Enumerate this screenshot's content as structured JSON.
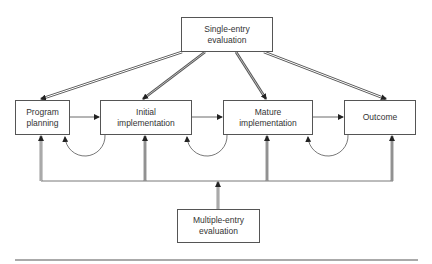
{
  "diagram": {
    "title": "",
    "nodes": {
      "single_entry": {
        "line1": "Single-entry",
        "line2": "evaluation"
      },
      "program_planning": {
        "line1": "Program",
        "line2": "planning"
      },
      "initial_implementation": {
        "line1": "Initial",
        "line2": "implementation"
      },
      "mature_implementation": {
        "line1": "Mature",
        "line2": "implementation"
      },
      "outcome": {
        "line1": "Outcome"
      },
      "multiple_entry": {
        "line1": "Multiple-entry",
        "line2": "evaluation"
      }
    },
    "edges": [
      {
        "from": "single_entry",
        "to": "program_planning",
        "style": "double"
      },
      {
        "from": "single_entry",
        "to": "initial_implementation",
        "style": "double"
      },
      {
        "from": "single_entry",
        "to": "mature_implementation",
        "style": "double"
      },
      {
        "from": "single_entry",
        "to": "outcome",
        "style": "double"
      },
      {
        "from": "program_planning",
        "to": "initial_implementation",
        "style": "single"
      },
      {
        "from": "initial_implementation",
        "to": "mature_implementation",
        "style": "single"
      },
      {
        "from": "mature_implementation",
        "to": "outcome",
        "style": "single"
      },
      {
        "from": "initial_implementation",
        "to": "program_planning",
        "style": "feedback-arc"
      },
      {
        "from": "mature_implementation",
        "to": "initial_implementation",
        "style": "feedback-arc"
      },
      {
        "from": "outcome",
        "to": "mature_implementation",
        "style": "feedback-arc"
      },
      {
        "from": "multiple_entry",
        "to": "program_planning",
        "style": "double"
      },
      {
        "from": "multiple_entry",
        "to": "initial_implementation",
        "style": "double"
      },
      {
        "from": "multiple_entry",
        "to": "mature_implementation",
        "style": "double"
      },
      {
        "from": "multiple_entry",
        "to": "outcome",
        "style": "double"
      }
    ],
    "colors": {
      "line": "#444444",
      "double_fill": "#bbbbbb"
    }
  }
}
